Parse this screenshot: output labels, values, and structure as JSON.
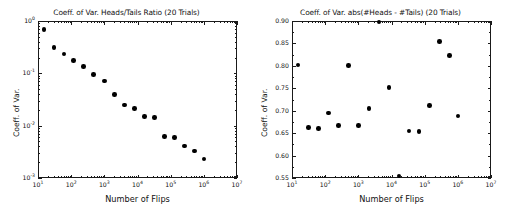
{
  "figure": {
    "width": 507,
    "height": 209,
    "background": "#ffffff",
    "marker_color": "#000000",
    "axis_color": "#1a1a1a",
    "panel_count": 2
  },
  "chart_data": [
    {
      "type": "scatter",
      "panel": "left",
      "title": "Coeff. of Var. Heads/Tails Ratio (20 Trials)",
      "xlabel": "Number of Flips",
      "ylabel": "Coeff. of Var.",
      "xscale": "log",
      "yscale": "log",
      "xlim": [
        10,
        10000000
      ],
      "ylim": [
        0.001,
        1
      ],
      "grid": false,
      "legend": null,
      "xticks": [
        10,
        100,
        1000,
        10000,
        100000,
        1000000,
        10000000
      ],
      "xticklabels": [
        "10^1",
        "10^2",
        "10^3",
        "10^4",
        "10^5",
        "10^6",
        "10^7"
      ],
      "yticks": [
        1,
        0.1,
        0.01,
        0.001
      ],
      "yticklabels": [
        "10^0",
        "10^-1",
        "10^-2",
        "10^-3"
      ],
      "x": [
        15,
        30,
        60,
        120,
        240,
        480,
        1000,
        2000,
        4000,
        8000,
        16000,
        32000,
        64000,
        130000,
        260000,
        520000,
        1000000
      ],
      "y": [
        0.68,
        0.31,
        0.235,
        0.175,
        0.135,
        0.095,
        0.071,
        0.039,
        0.025,
        0.0215,
        0.0148,
        0.0142,
        0.0062,
        0.006,
        0.0041,
        0.0033,
        0.0023
      ],
      "n_points": 17
    },
    {
      "type": "scatter",
      "panel": "right",
      "title": "Coeff. of Var. abs(#Heads - #Tails) (20 Trials)",
      "xlabel": "Number of Flips",
      "ylabel": "Coeff. of Var.",
      "xscale": "log",
      "yscale": "linear",
      "xlim": [
        10,
        10000000
      ],
      "ylim": [
        0.55,
        0.9
      ],
      "grid": false,
      "legend": null,
      "xticks": [
        10,
        100,
        1000,
        10000,
        100000,
        1000000,
        10000000
      ],
      "xticklabels": [
        "10^1",
        "10^2",
        "10^3",
        "10^4",
        "10^5",
        "10^6",
        "10^7"
      ],
      "yticks": [
        0.55,
        0.6,
        0.65,
        0.7,
        0.75,
        0.8,
        0.85,
        0.9
      ],
      "yticklabels": [
        "0.55",
        "0.60",
        "0.65",
        "0.70",
        "0.75",
        "0.80",
        "0.85",
        "0.90"
      ],
      "x": [
        15,
        32,
        62,
        125,
        250,
        500,
        1000,
        2100,
        4200,
        8500,
        17000,
        34000,
        68000,
        140000,
        280000,
        560000,
        1000000
      ],
      "y": [
        0.802,
        0.663,
        0.66,
        0.695,
        0.667,
        0.801,
        0.667,
        0.705,
        0.898,
        0.752,
        0.554,
        0.655,
        0.653,
        0.712,
        0.854,
        0.823,
        0.688
      ],
      "n_points": 17
    }
  ]
}
